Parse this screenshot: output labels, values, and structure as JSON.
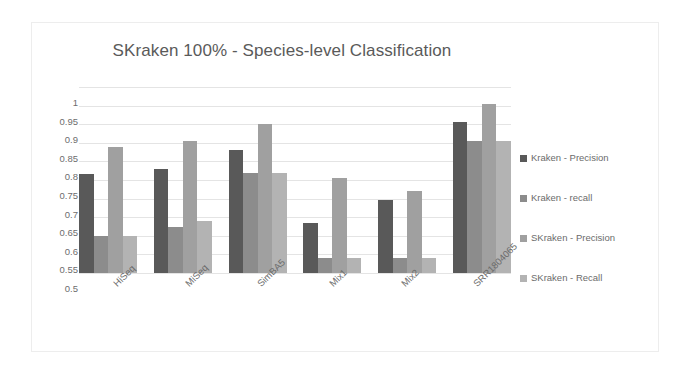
{
  "chart_data": {
    "type": "bar",
    "title": "SKraken 100% - Species-level Classification",
    "xlabel": "",
    "ylabel": "",
    "ylim": [
      0.5,
      1
    ],
    "ytick_labels": [
      "1",
      "0.95",
      "0.9",
      "0.85",
      "0.8",
      "0.75",
      "0.7",
      "0.65",
      "0.6",
      "0.55",
      "0.5"
    ],
    "ytick_values": [
      1,
      0.95,
      0.9,
      0.85,
      0.8,
      0.75,
      0.7,
      0.65,
      0.6,
      0.55,
      0.5
    ],
    "grid": true,
    "legend_position": "right",
    "categories": [
      "HiSeq",
      "MiSeq",
      "SimBA5",
      "Mix1",
      "Mix2",
      "SRR1804065"
    ],
    "series": [
      {
        "name": "Kraken - Precision",
        "color": "#595959",
        "values": [
          0.765,
          0.78,
          0.83,
          0.635,
          0.695,
          0.905
        ]
      },
      {
        "name": "Kraken - recall",
        "color": "#8c8c8c",
        "values": [
          0.6,
          0.625,
          0.77,
          0.54,
          0.54,
          0.855
        ]
      },
      {
        "name": "SKraken - Precision",
        "color": "#a0a0a0",
        "values": [
          0.84,
          0.855,
          0.9,
          0.755,
          0.72,
          0.955
        ]
      },
      {
        "name": "SKraken - Recall",
        "color": "#b3b3b3",
        "values": [
          0.6,
          0.64,
          0.77,
          0.54,
          0.54,
          0.855
        ]
      }
    ]
  }
}
